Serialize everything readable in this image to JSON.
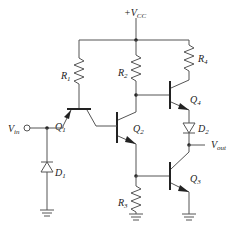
{
  "diagram": {
    "type": "circuit-schematic",
    "supply": {
      "label": "+V",
      "sub": "CC"
    },
    "input": {
      "label": "V",
      "sub": "in"
    },
    "output": {
      "label": "V",
      "sub": "out"
    },
    "components": {
      "R1": {
        "label": "R",
        "sub": "1"
      },
      "R2": {
        "label": "R",
        "sub": "2"
      },
      "R3": {
        "label": "R",
        "sub": "3"
      },
      "R4": {
        "label": "R",
        "sub": "4"
      },
      "Q1": {
        "label": "Q",
        "sub": "1"
      },
      "Q2": {
        "label": "Q",
        "sub": "2"
      },
      "Q3": {
        "label": "Q",
        "sub": "3"
      },
      "Q4": {
        "label": "Q",
        "sub": "4"
      },
      "D1": {
        "label": "D",
        "sub": "1"
      },
      "D2": {
        "label": "D",
        "sub": "2"
      }
    },
    "colors": {
      "wire": "#555555",
      "text": "#222222",
      "background": "#ffffff"
    }
  }
}
